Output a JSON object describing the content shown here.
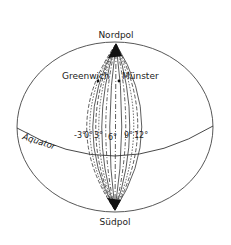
{
  "diagram": {
    "type": "globe-meridians",
    "labels": {
      "north_pole": "Nordpol",
      "south_pole": "Südpol",
      "equator": "Äquator",
      "greenwich": "Greenwich",
      "muenster": "Münster"
    },
    "meridians": [
      {
        "label": "-3°",
        "deg": -3
      },
      {
        "label": "0°",
        "deg": 0
      },
      {
        "label": "3°",
        "deg": 3
      },
      {
        "label": "6°",
        "deg": 6
      },
      {
        "label": "9°",
        "deg": 9
      },
      {
        "label": "12°",
        "deg": 12
      }
    ],
    "colors": {
      "line": "#333333",
      "background": "#ffffff"
    }
  }
}
